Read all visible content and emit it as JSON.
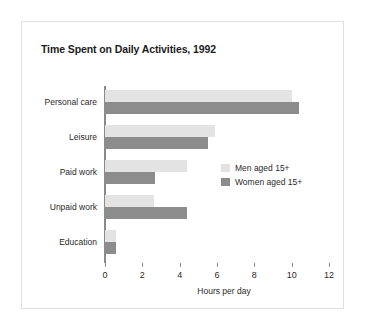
{
  "figure": {
    "background_color": "#ffffff",
    "border_color": "#e0e0e0"
  },
  "chart_data": {
    "type": "bar",
    "orientation": "horizontal",
    "title": "Time Spent on Daily Activities, 1992",
    "xlabel": "Hours per day",
    "ylabel": "",
    "categories": [
      "Personal care",
      "Leisure",
      "Paid work",
      "Unpaid work",
      "Education"
    ],
    "series": [
      {
        "name": "Men aged 15+",
        "color": "#e3e3e3",
        "values": [
          10.0,
          5.9,
          4.4,
          2.6,
          0.6
        ]
      },
      {
        "name": "Women aged 15+",
        "color": "#8c8c8c",
        "values": [
          10.4,
          5.5,
          2.7,
          4.4,
          0.6
        ]
      }
    ],
    "xlim": [
      0,
      12
    ],
    "xticks": [
      0,
      2,
      4,
      6,
      8,
      10,
      12
    ],
    "xtick_labels": [
      "0",
      "2",
      "4",
      "6",
      "8",
      "10",
      "12"
    ],
    "grid": false,
    "legend_position": "middle-right"
  }
}
